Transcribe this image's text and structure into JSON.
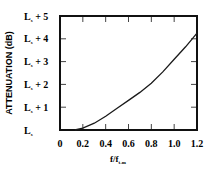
{
  "chart_data": {
    "type": "line",
    "title": "",
    "xlabel": "f/f",
    "xlabel_subscript": "t-m",
    "ylabel": "ATTENUATION (dB)",
    "xlim": [
      0,
      1.2
    ],
    "ylim": [
      0,
      5
    ],
    "x_ticks": [
      0,
      0.2,
      0.4,
      0.6,
      0.8,
      1.0,
      1.2
    ],
    "x_tick_labels": [
      "0",
      "0.2",
      "0.4",
      "0.6",
      "0.8",
      "1.0",
      "1.2"
    ],
    "y_ticks": [
      0,
      1,
      2,
      3,
      4,
      5
    ],
    "y_tick_labels": [
      "L",
      "L + 1",
      "L + 2",
      "L + 3",
      "L + 4",
      "L + 5"
    ],
    "y_tick_subscript": "s",
    "grid": false,
    "legend": null,
    "series": [
      {
        "name": "attenuation",
        "x": [
          0.13,
          0.2,
          0.3,
          0.4,
          0.5,
          0.6,
          0.7,
          0.8,
          0.9,
          1.0,
          1.1,
          1.2
        ],
        "y": [
          0.0,
          0.08,
          0.3,
          0.6,
          0.95,
          1.3,
          1.65,
          2.05,
          2.55,
          3.1,
          3.65,
          4.25
        ]
      }
    ],
    "colors": {
      "line": "#1a1a1a",
      "frame": "#111111",
      "background": "#ffffff"
    }
  }
}
